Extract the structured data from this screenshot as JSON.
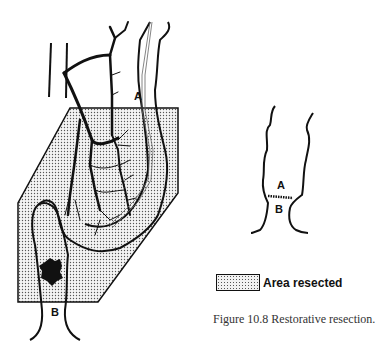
{
  "figure": {
    "caption": "Figure 10.8    Restorative resection.",
    "legend": {
      "label": "Area resected",
      "pattern": "stippled",
      "color": "#555555"
    },
    "main_diagram": {
      "labels": {
        "point_a": "A",
        "point_b": "B"
      }
    },
    "inset_diagram": {
      "labels": {
        "point_a": "A",
        "point_b": "B"
      }
    }
  }
}
